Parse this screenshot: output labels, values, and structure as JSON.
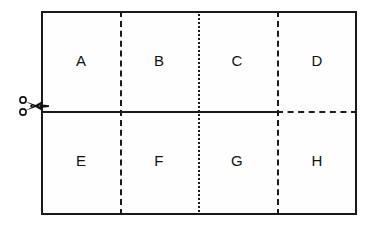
{
  "diagram": {
    "background_color": "#ffffff",
    "line_color": "#1a1a1a",
    "fill_color": "#fefefe",
    "cells": [
      {
        "label": "A",
        "row": "top",
        "column": 1
      },
      {
        "label": "B",
        "row": "top",
        "column": 2
      },
      {
        "label": "C",
        "row": "top",
        "column": 3
      },
      {
        "label": "D",
        "row": "top",
        "column": 4
      },
      {
        "label": "E",
        "row": "bottom",
        "column": 1
      },
      {
        "label": "F",
        "row": "bottom",
        "column": 2
      },
      {
        "label": "G",
        "row": "bottom",
        "column": 3
      },
      {
        "label": "H",
        "row": "bottom",
        "column": 4
      }
    ],
    "dividers": {
      "vertical": [
        {
          "index": 1,
          "style": "dashed",
          "between": "A/E and B/F"
        },
        {
          "index": 2,
          "style": "dotted",
          "between": "B/F and C/G"
        },
        {
          "index": 3,
          "style": "dashed",
          "between": "C/G and D/H"
        }
      ],
      "horizontal": [
        {
          "index": 1,
          "style": "solid-then-dashed",
          "between": "top row and bottom row"
        }
      ]
    },
    "cut_marker": {
      "icon": "scissors-icon",
      "position": "left-edge-of-horizontal-divider"
    }
  }
}
